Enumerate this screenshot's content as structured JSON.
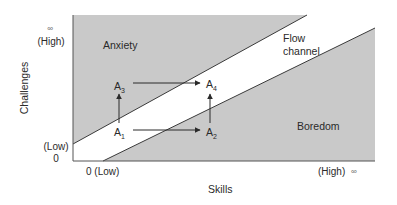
{
  "diagram": {
    "type": "flow-channel",
    "colors": {
      "region_fill": "#c9c9c9",
      "channel_fill": "#ffffff",
      "line": "#3a3a3a",
      "text": "#2a2a2a"
    },
    "axes": {
      "y_label": "Challenges",
      "x_label": "Skills",
      "y_high_symbol": "∞",
      "y_high": "(High)",
      "y_low": "(Low)",
      "y_zero": "0",
      "x_low": "0 (Low)",
      "x_high": "(High)",
      "x_high_symbol": "∞"
    },
    "regions": {
      "anxiety": "Anxiety",
      "flow_line1": "Flow",
      "flow_line2": "channel",
      "boredom": "Boredom"
    },
    "points": [
      {
        "id": "A1",
        "base": "A",
        "sub": "1"
      },
      {
        "id": "A2",
        "base": "A",
        "sub": "2"
      },
      {
        "id": "A3",
        "base": "A",
        "sub": "3"
      },
      {
        "id": "A4",
        "base": "A",
        "sub": "4"
      }
    ],
    "arrows": [
      {
        "from": "A1",
        "to": "A3"
      },
      {
        "from": "A1",
        "to": "A2"
      },
      {
        "from": "A3",
        "to": "A4"
      },
      {
        "from": "A2",
        "to": "A4"
      }
    ]
  }
}
